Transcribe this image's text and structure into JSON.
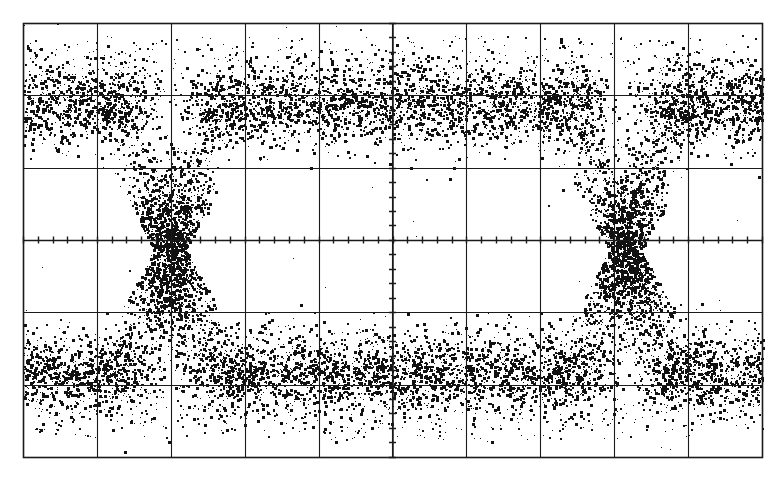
{
  "figure": {
    "kind": "oscilloscope-eye-diagram",
    "width": 782,
    "height": 481,
    "background_color": "#ffffff",
    "ink_color": "#111111",
    "graticule_color": "#1a1a1a",
    "caption": "",
    "title": ""
  },
  "graticule": {
    "left": 23,
    "top": 23,
    "right": 762,
    "bottom": 457,
    "columns": 10,
    "rows": 6,
    "division_width_px": 73.9,
    "division_height_px": 72.3,
    "border_width_px": 1.6,
    "grid_line_width_px": 1.1,
    "center_axis_x": 392.5,
    "center_axis_y": 240.0,
    "subticks_per_division": 5,
    "subtick_length_px": 7,
    "vertical_line_x": [
      23,
      97,
      171,
      245,
      319,
      392,
      466,
      540,
      614,
      688,
      762
    ],
    "horizontal_line_y": [
      23,
      95,
      168,
      240,
      312,
      385,
      457
    ]
  },
  "chart_data": {
    "type": "scatter",
    "title": "",
    "subtitle": "",
    "xlabel": "",
    "ylabel": "",
    "grid": true,
    "legend": null,
    "annotations": [],
    "axis_units": {
      "x": "div",
      "y": "div"
    },
    "xlim": [
      0,
      10
    ],
    "ylim": [
      0,
      6
    ],
    "xtick_labels": [],
    "ytick_labels": [],
    "series": [
      {
        "name": "logic-high-band",
        "role": "upper-rail",
        "y_center_div": 4.24,
        "y_center_px": 103,
        "thickness_px": 66,
        "x_span_px": [
          23,
          762
        ],
        "density": "very-high",
        "point_count": 5200
      },
      {
        "name": "logic-low-band",
        "role": "lower-rail",
        "y_center_div": 1.24,
        "y_center_px": 373,
        "thickness_px": 64,
        "x_span_px": [
          23,
          762
        ],
        "density": "very-high",
        "point_count": 5200
      },
      {
        "name": "crossing-left",
        "role": "eye-crossing",
        "x_center_px": 170,
        "y_center_px": 250,
        "width_px": 96,
        "density": "high",
        "point_count": 2100
      },
      {
        "name": "crossing-right",
        "role": "eye-crossing",
        "x_center_px": 625,
        "y_center_px": 250,
        "width_px": 96,
        "density": "high",
        "point_count": 2100
      },
      {
        "name": "transition-edges",
        "role": "rise-fall-transitions",
        "edge_x_px": [
          170,
          625
        ],
        "rise_time_px": 78,
        "point_count": 3000
      }
    ],
    "eye_metrics": {
      "eye_opening_left_px": 215,
      "eye_opening_right_px": 580,
      "eye_opening_top_px": 150,
      "eye_opening_bottom_px": 330,
      "crossing_level_px": 250,
      "unit_interval_px": 455
    },
    "noise": {
      "vertical_sigma_px": 17,
      "horizontal_jitter_sigma_px": 13,
      "dot_size_px": [
        1,
        3
      ],
      "total_points": 19600
    }
  }
}
